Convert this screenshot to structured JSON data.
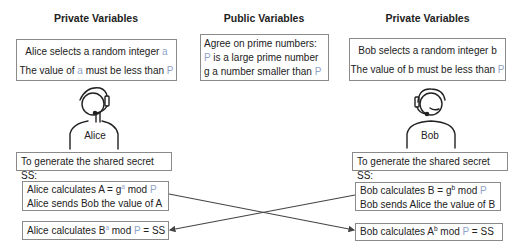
{
  "headings": {
    "alice_private": "Private Variables",
    "public": "Public Variables",
    "bob_private": "Private Variables"
  },
  "alice_private_box": {
    "line1_text": "Alice selects a random integer ",
    "line1_var": "a",
    "line2_pre": "The value of ",
    "line2_var": "a",
    "line2_mid": " must be less than ",
    "line2_var2": "P"
  },
  "public_box": {
    "line1": "Agree on prime numbers:",
    "line2_var": "P",
    "line2_text": " is a large prime number",
    "line3_text": "g a number smaller than ",
    "line3_var": "P"
  },
  "bob_private_box": {
    "line1": "Bob selects a random integer b",
    "line2_text": "The value of b must be less than ",
    "line2_var": "P"
  },
  "persons": {
    "alice": {
      "name": "Alice",
      "icon": "person-headset-icon"
    },
    "bob": {
      "name": "Bob",
      "icon": "person-headset-icon"
    }
  },
  "shared_secret_label": {
    "alice": "To generate the shared secret SS:",
    "bob": "To generate the shared secret SS:"
  },
  "alice_calc_box": {
    "line1_pre": "Alice calculates A = g",
    "line1_sup": "a",
    "line1_mid": " mod ",
    "line1_var": "P",
    "line2": "Alice sends Bob the value of A"
  },
  "alice_final_box": {
    "pre": "Alice calculates B",
    "sup": "a",
    "mid": " mod ",
    "var": "P",
    "post": " = SS"
  },
  "bob_calc_box": {
    "line1_pre": "Bob calculates B = g",
    "line1_sup": "b",
    "line1_mid": " mod ",
    "line1_var": "P",
    "line2": "Bob sends Alice the value of B"
  },
  "bob_final_box": {
    "pre": "Bob calculates A",
    "sup": "b",
    "mid": " mod ",
    "var": "P",
    "post": " = SS"
  },
  "colors": {
    "variable": "#8fa3c8",
    "border": "#8a8a8a",
    "arrow": "#444444"
  }
}
